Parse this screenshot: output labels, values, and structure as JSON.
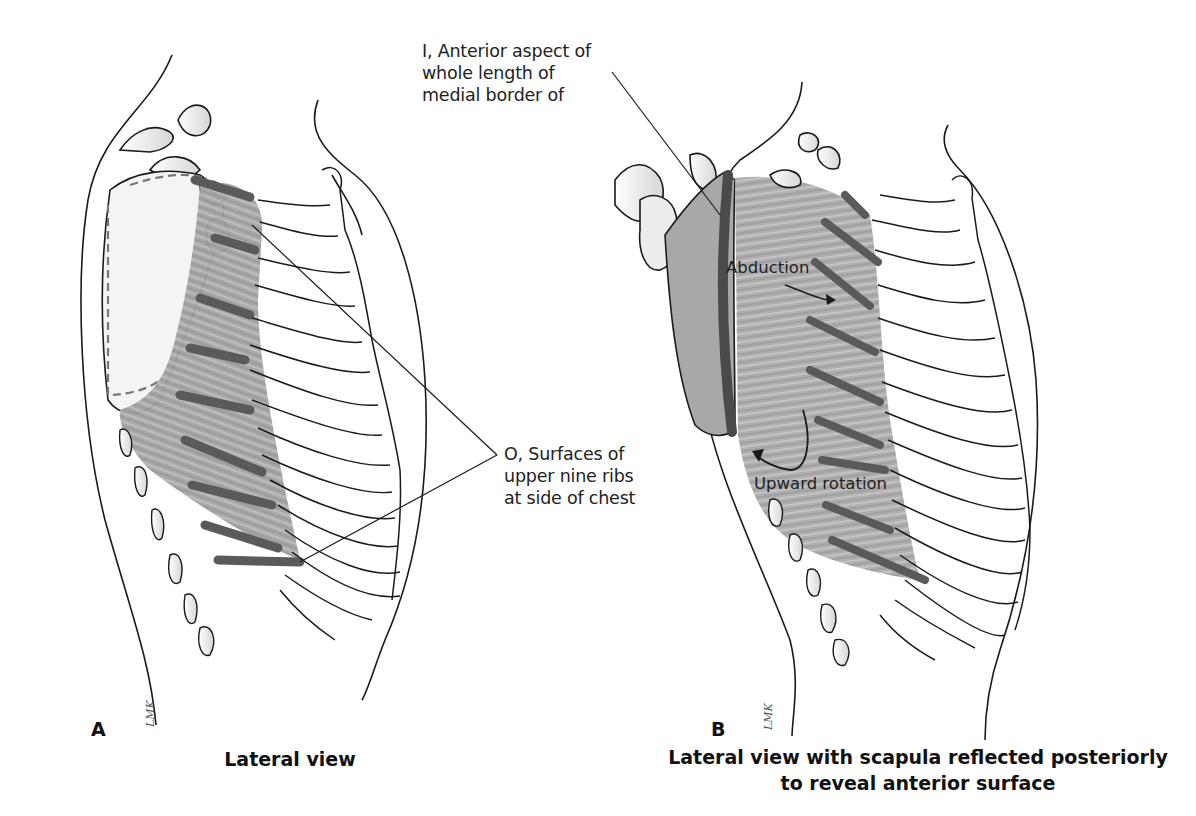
{
  "figure": {
    "panels": [
      {
        "letter": "A",
        "caption": "Lateral view",
        "artist_signature": "LMK"
      },
      {
        "letter": "B",
        "caption_line1": "Lateral view with scapula reflected posteriorly",
        "caption_line2": "to reveal anterior surface",
        "artist_signature": "LMK"
      }
    ],
    "labels": {
      "insertion": {
        "line1": "I, Anterior aspect of",
        "line2": "whole length of",
        "line3": "medial border of"
      },
      "origin": {
        "line1": "O, Surfaces of",
        "line2": "upper nine ribs",
        "line3": "at side of chest"
      }
    },
    "actions": {
      "abduction": "Abduction",
      "upward_rotation": "Upward rotation"
    },
    "colors": {
      "line": "#1a1a1a",
      "muscle": "#9a9a9a",
      "muscle_dark": "#5e5e5e",
      "bone_shade": "#d9d9d9",
      "background": "#ffffff"
    }
  }
}
